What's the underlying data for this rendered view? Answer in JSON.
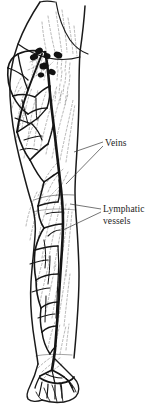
{
  "figure": {
    "background_color": "#ffffff",
    "ink_color": "#1a1a1a",
    "dashed_color": "#9a9a9a",
    "width": 156,
    "height": 408
  },
  "labels": {
    "veins": {
      "text": "Veins",
      "leader_count": 2
    },
    "lymphatic": {
      "line1": "Lymphatic",
      "line2": "vessels",
      "leader_count": 2
    }
  },
  "structures": {
    "limb_outline": "right lower limb, anterior view, from groin to foot",
    "lymph_nodes": {
      "name": "superficial inguinal lymph nodes",
      "count": 7,
      "fill": "#111111"
    },
    "great_saphenous_vein": "long solid vein running medially from groin to ankle",
    "vein_network": "branching superficial venous network with anastomoses",
    "lymphatic_plexus": "fine dashed vessels ascending toward inguinal nodes",
    "foot": "dorsal venous arch and digital veins over toes"
  }
}
